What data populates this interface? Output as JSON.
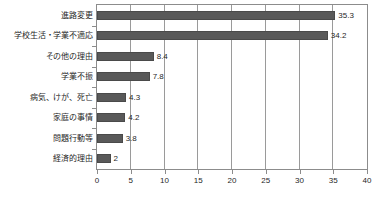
{
  "chart_data": {
    "type": "bar",
    "orientation": "horizontal",
    "title": "",
    "subtitle": "",
    "xlabel": "",
    "ylabel": "",
    "xlim": [
      0,
      40
    ],
    "xticks": [
      "0",
      "5",
      "10",
      "15",
      "20",
      "25",
      "30",
      "35",
      "40"
    ],
    "xtick_values": [
      0,
      5,
      10,
      15,
      20,
      25,
      30,
      35,
      40
    ],
    "grid": true,
    "grid_axis": "x",
    "legend": false,
    "legend_position": "none",
    "bar_color": "#595959",
    "categories": [
      "進路変更",
      "学校生活・学業不適応",
      "その他の理由",
      "学業不振",
      "病気、けが、死亡",
      "家庭の事情",
      "問題行動等",
      "経済的理由"
    ],
    "values": [
      35.3,
      34.2,
      8.4,
      7.8,
      4.3,
      4.2,
      3.8,
      2
    ],
    "value_labels": [
      "35.3",
      "34.2",
      "8.4",
      "7.8",
      "4.3",
      "4.2",
      "3.8",
      "2"
    ]
  }
}
